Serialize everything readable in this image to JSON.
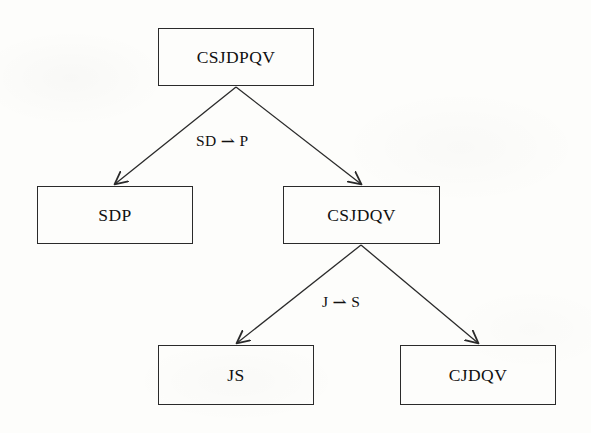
{
  "diagram": {
    "type": "tree-diagram",
    "background_color": "#fdfdfb",
    "stroke_color": "#2a2a2a",
    "text_color": "#101010",
    "nodes": [
      {
        "id": "root",
        "label": "CSJDPQV",
        "x": 158,
        "y": 28,
        "w": 156,
        "h": 58
      },
      {
        "id": "sdp",
        "label": "SDP",
        "x": 37,
        "y": 186,
        "w": 156,
        "h": 58
      },
      {
        "id": "csjdqv",
        "label": "CSJDQV",
        "x": 283,
        "y": 186,
        "w": 157,
        "h": 58
      },
      {
        "id": "js",
        "label": "JS",
        "x": 158,
        "y": 345,
        "w": 156,
        "h": 60
      },
      {
        "id": "cjdqv",
        "label": "CJDQV",
        "x": 400,
        "y": 345,
        "w": 156,
        "h": 60
      }
    ],
    "edges": [
      {
        "id": "root-to-sdp",
        "from": "root",
        "to": "sdp",
        "x1": 236,
        "y1": 87,
        "x2": 115,
        "y2": 184
      },
      {
        "id": "root-to-csjdqv",
        "from": "root",
        "to": "csjdqv",
        "x1": 236,
        "y1": 87,
        "x2": 361,
        "y2": 184
      },
      {
        "id": "csjdqv-to-js",
        "from": "csjdqv",
        "to": "js",
        "x1": 361,
        "y1": 245,
        "x2": 237,
        "y2": 343
      },
      {
        "id": "csjdqv-to-cjdqv",
        "from": "csjdqv",
        "to": "cjdqv",
        "x1": 361,
        "y1": 245,
        "x2": 478,
        "y2": 343
      }
    ],
    "edge_labels": [
      {
        "id": "label-sd-p",
        "lhs": "SD",
        "arrow": "⇀",
        "rhs": "P",
        "x": 196,
        "y": 130
      },
      {
        "id": "label-j-s",
        "lhs": "J",
        "arrow": "⇀",
        "rhs": "S",
        "x": 322,
        "y": 291
      }
    ]
  }
}
